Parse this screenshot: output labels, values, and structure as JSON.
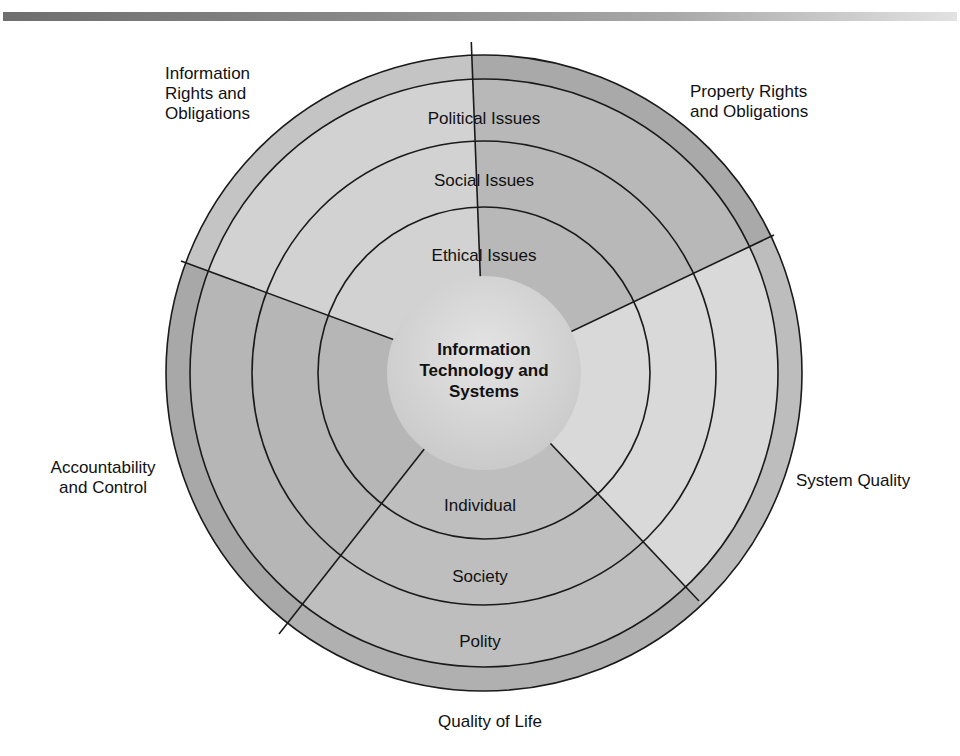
{
  "diagram": {
    "center_label": [
      "Information",
      "Technology and",
      "Systems"
    ],
    "rings": {
      "top": [
        "Political Issues",
        "Social Issues",
        "Ethical Issues"
      ],
      "bottom": [
        "Individual",
        "Society",
        "Polity"
      ]
    },
    "dimensions": [
      {
        "id": "information-rights",
        "label": [
          "Information",
          "Rights and",
          "Obligations"
        ]
      },
      {
        "id": "property-rights",
        "label": [
          "Property Rights",
          "and Obligations"
        ]
      },
      {
        "id": "system-quality",
        "label": [
          "System Quality"
        ]
      },
      {
        "id": "quality-of-life",
        "label": [
          "Quality of Life"
        ]
      },
      {
        "id": "accountability",
        "label": [
          "Accountability",
          "and Control"
        ]
      }
    ],
    "colors": {
      "line": "#1a1a1a",
      "info_rights": "#d0d0d0",
      "property": "#b5b5b5",
      "system_quality": "#d8d8d8",
      "quality_life": "#bcbcbc",
      "accountability": "#b3b3b3",
      "center": "#d6d6d6"
    }
  }
}
